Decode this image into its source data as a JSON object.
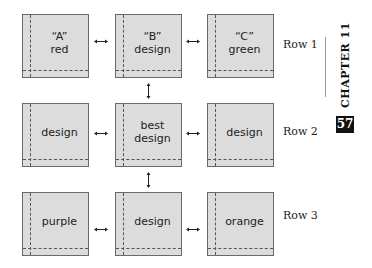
{
  "boxes": [
    {
      "row": 1,
      "col": 1,
      "label": "“A”\nred"
    },
    {
      "row": 1,
      "col": 2,
      "label": "“B”\ndesign"
    },
    {
      "row": 1,
      "col": 3,
      "label": "“C”\ngreen"
    },
    {
      "row": 2,
      "col": 1,
      "label": "design"
    },
    {
      "row": 2,
      "col": 2,
      "label": "best\ndesign"
    },
    {
      "row": 2,
      "col": 3,
      "label": "design"
    },
    {
      "row": 3,
      "col": 1,
      "label": "purple"
    },
    {
      "row": 3,
      "col": 2,
      "label": "design"
    },
    {
      "row": 3,
      "col": 3,
      "label": "orange"
    }
  ],
  "row_labels": [
    "Row 1",
    "Row 2",
    "Row 3"
  ],
  "sidebar": {
    "chapter": "CHAPTER 11",
    "page_number": "57"
  }
}
